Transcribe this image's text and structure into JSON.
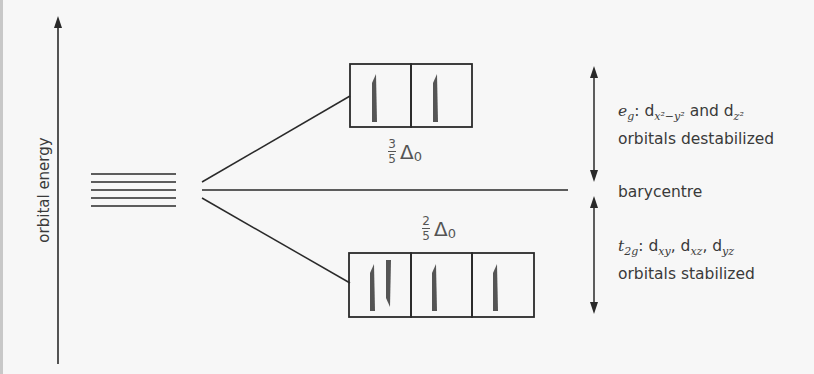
{
  "diagram": {
    "axis": {
      "label": "orbital energy"
    },
    "degenerate_levels": {
      "count": 5
    },
    "barycentre": {
      "label": "barycentre"
    },
    "eg": {
      "symbol": "e",
      "symbol_sub": "g",
      "orbital1_base": "d",
      "orbital1_sub": "x²−y²",
      "connector": "and",
      "orbital2_base": "d",
      "orbital2_sub": "z²",
      "description": "orbitals destabilized",
      "energy_fraction_num": "3",
      "energy_fraction_den": "5",
      "energy_symbol": "Δ",
      "energy_sub": "0",
      "boxes": [
        {
          "electrons": "up"
        },
        {
          "electrons": "up"
        }
      ]
    },
    "t2g": {
      "symbol": "t",
      "symbol_sub": "2g",
      "orbitals": [
        "xy",
        "xz",
        "yz"
      ],
      "orbital_base": "d",
      "description": "orbitals stabilized",
      "energy_fraction_num": "2",
      "energy_fraction_den": "5",
      "energy_symbol": "Δ",
      "energy_sub": "0",
      "boxes": [
        {
          "electrons": "up-down"
        },
        {
          "electrons": "up"
        },
        {
          "electrons": "up"
        }
      ]
    }
  }
}
